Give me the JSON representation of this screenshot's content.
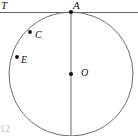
{
  "figure": {
    "type": "geometry-diagram",
    "background_color": "#ffffff",
    "stroke_color": "#55555a",
    "label_color": "#111111",
    "circle": {
      "center_x": 71,
      "center_y": 74,
      "radius": 62,
      "center_label": "O",
      "center_dot_radius": 2.0
    },
    "tangent_line": {
      "label": "T",
      "y": 12.5,
      "x_start": 0,
      "x_end": 138,
      "tangent_point_label": "A",
      "tangent_point_x": 71,
      "tangent_point_y": 12
    },
    "diameter": {
      "x": 71,
      "y_start": 12,
      "y_end": 136
    },
    "points": [
      {
        "name": "A",
        "label": "A",
        "x": 71,
        "y": 12,
        "dot": true
      },
      {
        "name": "C",
        "label": "C",
        "x": 30,
        "y": 32,
        "dot": true
      },
      {
        "name": "E",
        "label": "E",
        "x": 17,
        "y": 57,
        "dot": true
      },
      {
        "name": "O",
        "label": "O",
        "x": 71,
        "y": 74,
        "dot": true
      }
    ],
    "figure_number": "12"
  }
}
